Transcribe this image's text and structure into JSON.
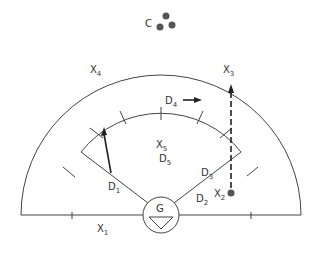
{
  "diagram": {
    "colors": {
      "stroke": "#444444",
      "text": "#333333",
      "dot": "#555555",
      "arrow": "#222222",
      "background": "#ffffff"
    },
    "cluster": {
      "label": "C"
    },
    "gate": {
      "label": "G"
    },
    "labels": {
      "x1": {
        "main": "X",
        "sub": "1"
      },
      "x2": {
        "main": "X",
        "sub": "2"
      },
      "x3": {
        "main": "X",
        "sub": "3"
      },
      "x4": {
        "main": "X",
        "sub": "4"
      },
      "x5": {
        "main": "X",
        "sub": "5"
      },
      "d1": {
        "main": "D",
        "sub": "1"
      },
      "d2": {
        "main": "D",
        "sub": "2"
      },
      "d3": {
        "main": "D",
        "sub": "3"
      },
      "d4": {
        "main": "D",
        "sub": "4"
      },
      "d5": {
        "main": "D",
        "sub": "5"
      }
    }
  }
}
